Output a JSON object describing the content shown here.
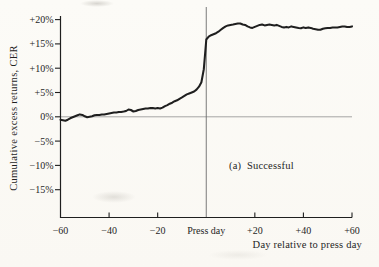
{
  "figure": {
    "kind": "scanned-book-figure",
    "caption_label": "(a)  Successful"
  },
  "colors": {
    "ink": "#1f1f1f",
    "paper": "#fbfaf6",
    "zero_line": "#8f8f8f",
    "press_line": "#6b6b6b"
  },
  "chart_data": {
    "type": "line",
    "title": "",
    "xlabel": "Day relative to press day",
    "ylabel": "Cumulative excess returns, CER",
    "annotation": "(a)  Successful",
    "xlim": [
      -60,
      60
    ],
    "ylim": [
      -20,
      20
    ],
    "grid": "off",
    "legend": "none",
    "event_line_x": 0,
    "zero_reference_line": true,
    "x_ticks": [
      {
        "day": -60,
        "label": "−60"
      },
      {
        "day": -40,
        "label": "−40"
      },
      {
        "day": -20,
        "label": "−20"
      },
      {
        "day": 0,
        "label": "Press day"
      },
      {
        "day": 20,
        "label": "+20"
      },
      {
        "day": 40,
        "label": "+40"
      },
      {
        "day": 60,
        "label": "+60"
      }
    ],
    "y_ticks": [
      {
        "value": 20,
        "label": "+20%"
      },
      {
        "value": 15,
        "label": "+15%"
      },
      {
        "value": 10,
        "label": "+10%"
      },
      {
        "value": 5,
        "label": "+5%"
      },
      {
        "value": 0,
        "label": "0%"
      },
      {
        "value": -5,
        "label": "−5%"
      },
      {
        "value": -10,
        "label": "−10%"
      },
      {
        "value": -15,
        "label": "−15%"
      }
    ],
    "series": [
      {
        "name": "Successful",
        "units": "percent cumulative excess return",
        "points": [
          [
            -60,
            -0.6
          ],
          [
            -59,
            -0.7
          ],
          [
            -58,
            -0.8
          ],
          [
            -57,
            -0.6
          ],
          [
            -56,
            -0.3
          ],
          [
            -55,
            -0.1
          ],
          [
            -54,
            0.1
          ],
          [
            -53,
            0.3
          ],
          [
            -52,
            0.5
          ],
          [
            -51,
            0.4
          ],
          [
            -50,
            0.1
          ],
          [
            -49,
            -0.1
          ],
          [
            -48,
            0.0
          ],
          [
            -47,
            0.1
          ],
          [
            -46,
            0.3
          ],
          [
            -45,
            0.4
          ],
          [
            -44,
            0.4
          ],
          [
            -43,
            0.5
          ],
          [
            -42,
            0.5
          ],
          [
            -41,
            0.6
          ],
          [
            -40,
            0.7
          ],
          [
            -39,
            0.8
          ],
          [
            -38,
            0.9
          ],
          [
            -37,
            0.9
          ],
          [
            -36,
            1.0
          ],
          [
            -35,
            1.0
          ],
          [
            -34,
            1.1
          ],
          [
            -33,
            1.2
          ],
          [
            -32,
            1.5
          ],
          [
            -31,
            1.4
          ],
          [
            -30,
            1.1
          ],
          [
            -29,
            1.2
          ],
          [
            -28,
            1.4
          ],
          [
            -27,
            1.5
          ],
          [
            -26,
            1.6
          ],
          [
            -25,
            1.7
          ],
          [
            -24,
            1.7
          ],
          [
            -23,
            1.8
          ],
          [
            -22,
            1.8
          ],
          [
            -21,
            1.7
          ],
          [
            -20,
            1.8
          ],
          [
            -19,
            1.7
          ],
          [
            -18,
            1.9
          ],
          [
            -17,
            2.2
          ],
          [
            -16,
            2.4
          ],
          [
            -15,
            2.7
          ],
          [
            -14,
            2.9
          ],
          [
            -13,
            3.2
          ],
          [
            -12,
            3.4
          ],
          [
            -11,
            3.7
          ],
          [
            -10,
            4.0
          ],
          [
            -9,
            4.3
          ],
          [
            -8,
            4.6
          ],
          [
            -7,
            4.8
          ],
          [
            -6,
            5.0
          ],
          [
            -5,
            5.2
          ],
          [
            -4,
            5.6
          ],
          [
            -3,
            6.2
          ],
          [
            -2,
            7.1
          ],
          [
            -1,
            9.8
          ],
          [
            0,
            15.9
          ],
          [
            1,
            16.5
          ],
          [
            2,
            16.8
          ],
          [
            3,
            17.0
          ],
          [
            4,
            17.2
          ],
          [
            5,
            17.5
          ],
          [
            6,
            17.9
          ],
          [
            7,
            18.3
          ],
          [
            8,
            18.6
          ],
          [
            9,
            18.8
          ],
          [
            10,
            18.9
          ],
          [
            11,
            19.0
          ],
          [
            12,
            19.1
          ],
          [
            13,
            19.2
          ],
          [
            14,
            19.2
          ],
          [
            15,
            19.0
          ],
          [
            16,
            18.9
          ],
          [
            17,
            18.6
          ],
          [
            18,
            18.4
          ],
          [
            19,
            18.3
          ],
          [
            20,
            18.5
          ],
          [
            21,
            18.7
          ],
          [
            22,
            18.9
          ],
          [
            23,
            19.0
          ],
          [
            24,
            18.8
          ],
          [
            25,
            18.9
          ],
          [
            26,
            19.0
          ],
          [
            27,
            18.9
          ],
          [
            28,
            18.8
          ],
          [
            29,
            18.9
          ],
          [
            30,
            18.7
          ],
          [
            31,
            18.5
          ],
          [
            32,
            18.4
          ],
          [
            33,
            18.5
          ],
          [
            34,
            18.4
          ],
          [
            35,
            18.6
          ],
          [
            36,
            18.5
          ],
          [
            37,
            18.4
          ],
          [
            38,
            18.3
          ],
          [
            39,
            18.2
          ],
          [
            40,
            18.4
          ],
          [
            41,
            18.3
          ],
          [
            42,
            18.4
          ],
          [
            43,
            18.3
          ],
          [
            44,
            18.1
          ],
          [
            45,
            18.0
          ],
          [
            46,
            17.9
          ],
          [
            47,
            17.9
          ],
          [
            48,
            18.1
          ],
          [
            49,
            18.2
          ],
          [
            50,
            18.3
          ],
          [
            51,
            18.3
          ],
          [
            52,
            18.4
          ],
          [
            53,
            18.4
          ],
          [
            54,
            18.4
          ],
          [
            55,
            18.5
          ],
          [
            56,
            18.6
          ],
          [
            57,
            18.6
          ],
          [
            58,
            18.5
          ],
          [
            59,
            18.5
          ],
          [
            60,
            18.6
          ]
        ]
      }
    ]
  }
}
